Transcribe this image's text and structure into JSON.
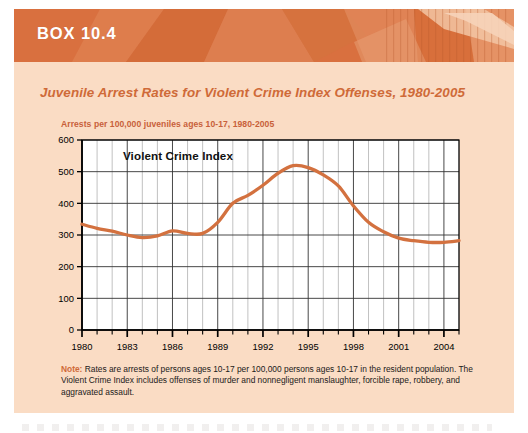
{
  "box": {
    "label": "BOX 10.4",
    "title": "Juvenile Arrest Rates for Violent Crime Index Offenses, 1980-2005"
  },
  "colors": {
    "header_band": "#d9703f",
    "panel_background": "#fadcc4",
    "accent_orange": "#cf6a38",
    "line": "#d3713f",
    "axis": "#000000",
    "gridline": "#3a3a3a"
  },
  "note": {
    "keyword": "Note:",
    "text": " Rates are arrests of persons ages 10-17 per 100,000 persons ages 10-17 in the resident population. The Violent Crime Index includes offenses of murder and nonnegligent manslaughter, forcible rape, robbery, and aggravated assault."
  },
  "chart_data": {
    "type": "line",
    "title": "Arrests per 100,000 juveniles ages 10-17, 1980-2005",
    "xlabel": "",
    "ylabel": "",
    "ylim": [
      0,
      600
    ],
    "ytick_values": [
      0,
      100,
      200,
      300,
      400,
      500,
      600
    ],
    "ytick_labels": [
      "0",
      "100",
      "200",
      "300",
      "400",
      "500",
      "600"
    ],
    "xlim": [
      1980,
      2005
    ],
    "xtick_labels": [
      "1980",
      "1983",
      "1986",
      "1989",
      "1992",
      "1995",
      "1998",
      "2001",
      "2004"
    ],
    "xtick_values": [
      1980,
      1983,
      1986,
      1989,
      1992,
      1995,
      1998,
      2001,
      2004
    ],
    "grid": true,
    "legend_position": "inside-top-left",
    "series": [
      {
        "name": "Violent Crime Index",
        "x": [
          1980,
          1981,
          1982,
          1983,
          1984,
          1985,
          1986,
          1987,
          1988,
          1989,
          1990,
          1991,
          1992,
          1993,
          1994,
          1995,
          1996,
          1997,
          1998,
          1999,
          2000,
          2001,
          2002,
          2003,
          2004,
          2005
        ],
        "values": [
          334,
          321,
          312,
          300,
          292,
          297,
          313,
          305,
          305,
          340,
          400,
          425,
          457,
          495,
          519,
          513,
          490,
          455,
          392,
          340,
          310,
          290,
          282,
          277,
          277,
          282
        ]
      }
    ]
  }
}
